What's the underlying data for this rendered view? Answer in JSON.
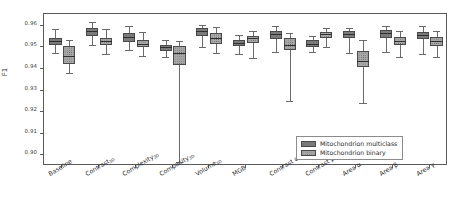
{
  "chart_data": {
    "type": "box",
    "title": "",
    "xlabel": "",
    "ylabel": "F1",
    "ylim": [
      0.895,
      0.9655
    ],
    "yticks": [
      0.96,
      0.95,
      0.94,
      0.93,
      0.92,
      0.91,
      0.9
    ],
    "ytick_labels": [
      "0.96",
      "0.95",
      "0.94",
      "0.93",
      "0.92",
      "0.91",
      "0.90"
    ],
    "grid": false,
    "legend_position": "lower-right-inside",
    "categories": [
      "Baseline",
      "Contrast3D",
      "Complexity3D",
      "Compacity3D",
      "Volume3D",
      "MGB",
      "Contrast α",
      "Contrast β",
      "Area α",
      "Area β",
      "Area γ"
    ],
    "category_labels": [
      {
        "base": "Baseline",
        "sub": ""
      },
      {
        "base": "Contrast",
        "sub": "3D"
      },
      {
        "base": "Complexity",
        "sub": "3D"
      },
      {
        "base": "Compacity",
        "sub": "3D"
      },
      {
        "base": "Volume",
        "sub": "3D"
      },
      {
        "base": "MGB",
        "sub": ""
      },
      {
        "base": "Contrast α",
        "sub": ""
      },
      {
        "base": "Contrast β",
        "sub": ""
      },
      {
        "base": "Area α",
        "sub": ""
      },
      {
        "base": "Area β",
        "sub": ""
      },
      {
        "base": "Area γ",
        "sub": ""
      }
    ],
    "series": [
      {
        "name": "Mitochondrion multiclass",
        "color": "#7a7a7a",
        "fill": "solid",
        "boxes": [
          {
            "category": "Baseline",
            "whisker_low": 0.9472,
            "q1": 0.9513,
            "median": 0.953,
            "q3": 0.9545,
            "whisker_high": 0.9585
          },
          {
            "category": "Contrast3D",
            "whisker_low": 0.9513,
            "q1": 0.9555,
            "median": 0.9578,
            "q3": 0.9592,
            "whisker_high": 0.962
          },
          {
            "category": "Complexity3D",
            "whisker_low": 0.949,
            "q1": 0.9523,
            "median": 0.9548,
            "q3": 0.9568,
            "whisker_high": 0.96
          },
          {
            "category": "Compacity3D",
            "whisker_low": 0.9455,
            "q1": 0.9485,
            "median": 0.95,
            "q3": 0.9512,
            "whisker_high": 0.9533
          },
          {
            "category": "Volume3D",
            "whisker_low": 0.9503,
            "q1": 0.9555,
            "median": 0.9577,
            "q3": 0.959,
            "whisker_high": 0.9605
          },
          {
            "category": "MGB",
            "whisker_low": 0.947,
            "q1": 0.9505,
            "median": 0.952,
            "q3": 0.9535,
            "whisker_high": 0.9558
          },
          {
            "category": "Contrast α",
            "whisker_low": 0.948,
            "q1": 0.954,
            "median": 0.956,
            "q3": 0.9578,
            "whisker_high": 0.96
          },
          {
            "category": "Contrast β",
            "whisker_low": 0.9478,
            "q1": 0.9502,
            "median": 0.9518,
            "q3": 0.9533,
            "whisker_high": 0.9553
          },
          {
            "category": "Area α",
            "whisker_low": 0.9472,
            "q1": 0.9542,
            "median": 0.956,
            "q3": 0.9575,
            "whisker_high": 0.9588
          },
          {
            "category": "Area β",
            "whisker_low": 0.9478,
            "q1": 0.9545,
            "median": 0.9565,
            "q3": 0.958,
            "whisker_high": 0.96
          },
          {
            "category": "Area γ",
            "whisker_low": 0.947,
            "q1": 0.954,
            "median": 0.9558,
            "q3": 0.9572,
            "whisker_high": 0.9598
          }
        ]
      },
      {
        "name": "Mitochondrion binary",
        "color": "#a8a8a8",
        "fill": "dotted",
        "boxes": [
          {
            "category": "Baseline",
            "whisker_low": 0.9383,
            "q1": 0.9425,
            "median": 0.9458,
            "q3": 0.9505,
            "whisker_high": 0.9535
          },
          {
            "category": "Contrast3D",
            "whisker_low": 0.9468,
            "q1": 0.9512,
            "median": 0.953,
            "q3": 0.9545,
            "whisker_high": 0.9585
          },
          {
            "category": "Complexity3D",
            "whisker_low": 0.946,
            "q1": 0.95,
            "median": 0.9518,
            "q3": 0.9533,
            "whisker_high": 0.957
          },
          {
            "category": "Compacity3D",
            "whisker_low": 0.897,
            "q1": 0.9418,
            "median": 0.9475,
            "q3": 0.9505,
            "whisker_high": 0.9528
          },
          {
            "category": "Volume3D",
            "whisker_low": 0.9475,
            "q1": 0.9518,
            "median": 0.9543,
            "q3": 0.9565,
            "whisker_high": 0.9593
          },
          {
            "category": "MGB",
            "whisker_low": 0.945,
            "q1": 0.952,
            "median": 0.9543,
            "q3": 0.9555,
            "whisker_high": 0.9575
          },
          {
            "category": "Contrast α",
            "whisker_low": 0.9253,
            "q1": 0.949,
            "median": 0.9513,
            "q3": 0.9543,
            "whisker_high": 0.9568
          },
          {
            "category": "Contrast β",
            "whisker_low": 0.9503,
            "q1": 0.9545,
            "median": 0.956,
            "q3": 0.9573,
            "whisker_high": 0.9588
          },
          {
            "category": "Area α",
            "whisker_low": 0.924,
            "q1": 0.941,
            "median": 0.9437,
            "q3": 0.9483,
            "whisker_high": 0.9533
          },
          {
            "category": "Area β",
            "whisker_low": 0.9455,
            "q1": 0.9512,
            "median": 0.9532,
            "q3": 0.9548,
            "whisker_high": 0.9578
          },
          {
            "category": "Area γ",
            "whisker_low": 0.9455,
            "q1": 0.9505,
            "median": 0.9528,
            "q3": 0.9548,
            "whisker_high": 0.9578
          }
        ]
      }
    ],
    "legend": [
      {
        "label": "Mitochondrion multiclass",
        "color": "#7a7a7a",
        "fill": "solid"
      },
      {
        "label": "Mitochondrion binary",
        "color": "#a8a8a8",
        "fill": "dotted"
      }
    ]
  }
}
